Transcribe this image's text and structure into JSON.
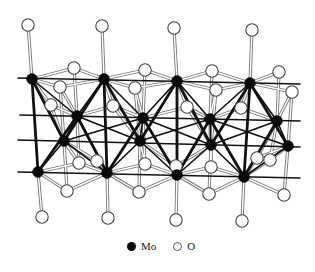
{
  "figure": {
    "title": ""
  },
  "legend": {
    "mo_label": "Mo",
    "o_label": "O",
    "mo_color": "#0a0a0a",
    "o_color": "#ffffff"
  },
  "mo_atoms": [
    {
      "x": 32,
      "y": 79
    },
    {
      "x": 104,
      "y": 79
    },
    {
      "x": 177,
      "y": 81
    },
    {
      "x": 250,
      "y": 83
    },
    {
      "x": 77,
      "y": 116
    },
    {
      "x": 143,
      "y": 118
    },
    {
      "x": 210,
      "y": 119
    },
    {
      "x": 277,
      "y": 121
    },
    {
      "x": 64,
      "y": 141
    },
    {
      "x": 140,
      "y": 141
    },
    {
      "x": 211,
      "y": 145
    },
    {
      "x": 288,
      "y": 146
    },
    {
      "x": 38,
      "y": 172
    },
    {
      "x": 107,
      "y": 173
    },
    {
      "x": 177,
      "y": 175
    },
    {
      "x": 244,
      "y": 177
    }
  ],
  "o_atoms": [
    {
      "x": 28,
      "y": 25
    },
    {
      "x": 102,
      "y": 26
    },
    {
      "x": 174,
      "y": 28
    },
    {
      "x": 252,
      "y": 30
    },
    {
      "x": 74,
      "y": 68
    },
    {
      "x": 145,
      "y": 70
    },
    {
      "x": 212,
      "y": 71
    },
    {
      "x": 279,
      "y": 72
    },
    {
      "x": 60,
      "y": 87
    },
    {
      "x": 135,
      "y": 88
    },
    {
      "x": 216,
      "y": 90
    },
    {
      "x": 292,
      "y": 92
    },
    {
      "x": 51,
      "y": 105
    },
    {
      "x": 113,
      "y": 106
    },
    {
      "x": 187,
      "y": 107
    },
    {
      "x": 241,
      "y": 108
    },
    {
      "x": 97,
      "y": 161
    },
    {
      "x": 79,
      "y": 163
    },
    {
      "x": 145,
      "y": 164
    },
    {
      "x": 176,
      "y": 166
    },
    {
      "x": 211,
      "y": 167
    },
    {
      "x": 270,
      "y": 160
    },
    {
      "x": 257,
      "y": 158
    },
    {
      "x": 67,
      "y": 191
    },
    {
      "x": 139,
      "y": 192
    },
    {
      "x": 209,
      "y": 194
    },
    {
      "x": 284,
      "y": 195
    },
    {
      "x": 42,
      "y": 217
    },
    {
      "x": 108,
      "y": 218
    },
    {
      "x": 176,
      "y": 220
    },
    {
      "x": 242,
      "y": 221
    }
  ],
  "horizontal_lines": [
    {
      "x1": 18,
      "y1": 78,
      "x2": 300,
      "y2": 84
    },
    {
      "x1": 20,
      "y1": 115,
      "x2": 300,
      "y2": 121
    },
    {
      "x1": 18,
      "y1": 140,
      "x2": 300,
      "y2": 147
    },
    {
      "x1": 18,
      "y1": 172,
      "x2": 300,
      "y2": 178
    }
  ]
}
